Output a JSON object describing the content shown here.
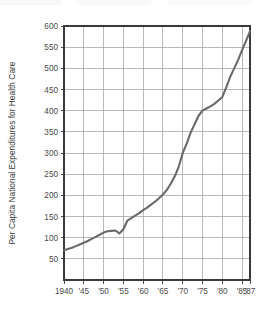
{
  "chart_data": {
    "type": "line",
    "title": "",
    "xlabel": "",
    "ylabel": "Per Capita National Expenditures for Health Care",
    "xlim": [
      1940,
      1987
    ],
    "ylim": [
      0,
      600
    ],
    "grid": true,
    "legend": "none",
    "accent_color": "#6a6a6a",
    "axis_color": "#3a3a3a",
    "grid_color": "#9a9a9a",
    "background_color": "#ffffff",
    "ytick_labels": [
      "50",
      "100",
      "150",
      "200",
      "250",
      "300",
      "350",
      "400",
      "450",
      "500",
      "550",
      "600"
    ],
    "ytick_values": [
      50,
      100,
      150,
      200,
      250,
      300,
      350,
      400,
      450,
      500,
      550,
      600
    ],
    "ytick_step": 50,
    "xtick_labels": [
      "1940",
      "'45",
      "'50",
      "'55",
      "'60",
      "'65",
      "'70",
      "'75",
      "'80",
      "'85",
      "'87"
    ],
    "xtick_values": [
      1940,
      1945,
      1950,
      1955,
      1960,
      1965,
      1970,
      1975,
      1980,
      1985,
      1987
    ],
    "series": [
      {
        "name": "Per Capita National Expenditures for Health Care",
        "x": [
          1940,
          1941,
          1942,
          1943,
          1944,
          1945,
          1946,
          1947,
          1948,
          1949,
          1950,
          1951,
          1952,
          1953,
          1954,
          1955,
          1956,
          1957,
          1958,
          1959,
          1960,
          1961,
          1962,
          1963,
          1964,
          1965,
          1966,
          1967,
          1968,
          1969,
          1970,
          1971,
          1972,
          1973,
          1974,
          1975,
          1976,
          1977,
          1978,
          1979,
          1980,
          1981,
          1982,
          1983,
          1984,
          1985,
          1986,
          1987
        ],
        "values": [
          70,
          73,
          76,
          80,
          84,
          88,
          92,
          97,
          102,
          107,
          112,
          115,
          116,
          117,
          110,
          120,
          140,
          146,
          152,
          158,
          165,
          171,
          178,
          185,
          193,
          202,
          213,
          228,
          245,
          268,
          300,
          322,
          348,
          368,
          388,
          400,
          405,
          410,
          416,
          424,
          432,
          455,
          480,
          500,
          520,
          543,
          565,
          588
        ]
      }
    ],
    "annotations": [
      {
        "label": "dip",
        "x": 1954,
        "y": 110
      },
      {
        "label": "final-value",
        "x": 1987,
        "y": 588
      }
    ]
  },
  "figure": {
    "plot_left": 64,
    "plot_right": 250,
    "plot_top": 26,
    "plot_bottom": 280
  }
}
